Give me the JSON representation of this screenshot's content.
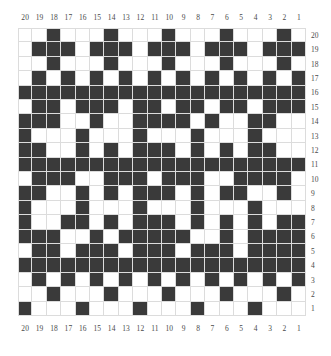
{
  "colors": {
    "filled": "#3a3a3a",
    "empty": "#ffffff",
    "gridline": "#dcdcdc",
    "label": "#4a4a4a",
    "background": "#ffffff"
  },
  "axes": {
    "column_labels_top": [
      "20",
      "19",
      "18",
      "17",
      "16",
      "15",
      "14",
      "13",
      "12",
      "11",
      "10",
      "9",
      "8",
      "7",
      "6",
      "5",
      "4",
      "3",
      "2",
      "1"
    ],
    "column_labels_bottom": [
      "20",
      "19",
      "18",
      "17",
      "16",
      "15",
      "14",
      "13",
      "12",
      "11",
      "10",
      "9",
      "8",
      "7",
      "6",
      "5",
      "4",
      "3",
      "2",
      "1"
    ],
    "row_labels_right": [
      "20",
      "19",
      "18",
      "17",
      "16",
      "15",
      "14",
      "13",
      "12",
      "11",
      "10",
      "9",
      "8",
      "7",
      "6",
      "5",
      "4",
      "3",
      "2",
      "1"
    ]
  },
  "chart_data": {
    "type": "heatmap",
    "title": "",
    "xlabel": "",
    "ylabel": "",
    "rows": 20,
    "cols": 20,
    "value_map": {
      "0": "empty",
      "1": "filled"
    },
    "x_tick_labels": [
      "20",
      "19",
      "18",
      "17",
      "16",
      "15",
      "14",
      "13",
      "12",
      "11",
      "10",
      "9",
      "8",
      "7",
      "6",
      "5",
      "4",
      "3",
      "2",
      "1"
    ],
    "y_tick_labels": [
      "20",
      "19",
      "18",
      "17",
      "16",
      "15",
      "14",
      "13",
      "12",
      "11",
      "10",
      "9",
      "8",
      "7",
      "6",
      "5",
      "4",
      "3",
      "2",
      "1"
    ],
    "grid": true,
    "legend": "none",
    "matrix": [
      [
        0,
        0,
        1,
        0,
        0,
        0,
        1,
        0,
        0,
        0,
        1,
        0,
        0,
        0,
        1,
        0,
        0,
        0,
        1,
        0
      ],
      [
        0,
        1,
        1,
        1,
        0,
        1,
        1,
        1,
        0,
        1,
        1,
        1,
        0,
        1,
        1,
        1,
        0,
        1,
        1,
        1
      ],
      [
        0,
        0,
        1,
        0,
        0,
        0,
        1,
        0,
        0,
        0,
        1,
        0,
        0,
        0,
        1,
        0,
        0,
        0,
        1,
        0
      ],
      [
        0,
        1,
        0,
        1,
        0,
        1,
        0,
        1,
        0,
        1,
        0,
        1,
        0,
        1,
        0,
        1,
        0,
        1,
        0,
        1
      ],
      [
        1,
        1,
        1,
        1,
        1,
        1,
        1,
        1,
        1,
        1,
        1,
        1,
        1,
        1,
        1,
        1,
        1,
        1,
        1,
        1
      ],
      [
        0,
        1,
        1,
        0,
        1,
        1,
        1,
        0,
        1,
        1,
        0,
        1,
        1,
        0,
        1,
        1,
        0,
        1,
        1,
        1
      ],
      [
        1,
        1,
        1,
        0,
        0,
        1,
        0,
        0,
        1,
        1,
        1,
        1,
        0,
        1,
        0,
        0,
        1,
        1,
        0,
        0
      ],
      [
        1,
        0,
        0,
        0,
        1,
        0,
        0,
        0,
        1,
        0,
        0,
        0,
        1,
        0,
        0,
        0,
        1,
        0,
        0,
        0
      ],
      [
        1,
        1,
        0,
        0,
        1,
        0,
        1,
        0,
        1,
        1,
        1,
        0,
        1,
        0,
        1,
        0,
        1,
        1,
        0,
        0
      ],
      [
        1,
        1,
        1,
        1,
        1,
        1,
        1,
        1,
        1,
        1,
        1,
        1,
        1,
        1,
        1,
        1,
        1,
        1,
        1,
        1
      ],
      [
        0,
        1,
        1,
        1,
        0,
        0,
        1,
        1,
        1,
        0,
        1,
        1,
        1,
        0,
        0,
        1,
        1,
        1,
        1,
        0
      ],
      [
        1,
        1,
        0,
        0,
        1,
        0,
        1,
        0,
        1,
        1,
        1,
        0,
        1,
        0,
        1,
        1,
        0,
        0,
        1,
        0
      ],
      [
        1,
        0,
        0,
        0,
        1,
        0,
        0,
        0,
        1,
        0,
        0,
        0,
        1,
        0,
        0,
        0,
        1,
        0,
        0,
        0
      ],
      [
        1,
        0,
        0,
        1,
        1,
        0,
        1,
        0,
        1,
        1,
        1,
        0,
        1,
        0,
        1,
        0,
        1,
        0,
        1,
        1
      ],
      [
        1,
        1,
        1,
        0,
        0,
        1,
        0,
        1,
        1,
        1,
        1,
        1,
        0,
        0,
        1,
        0,
        1,
        1,
        1,
        1
      ],
      [
        0,
        1,
        1,
        0,
        1,
        1,
        1,
        0,
        1,
        1,
        1,
        0,
        1,
        1,
        1,
        0,
        1,
        1,
        1,
        1
      ],
      [
        1,
        1,
        1,
        1,
        1,
        1,
        1,
        1,
        1,
        1,
        1,
        1,
        1,
        1,
        1,
        1,
        1,
        1,
        1,
        1
      ],
      [
        0,
        1,
        0,
        1,
        0,
        1,
        0,
        1,
        0,
        1,
        0,
        1,
        0,
        1,
        0,
        1,
        0,
        1,
        0,
        1
      ],
      [
        0,
        0,
        1,
        0,
        0,
        0,
        1,
        0,
        0,
        0,
        1,
        0,
        0,
        0,
        1,
        0,
        0,
        0,
        1,
        0
      ],
      [
        1,
        0,
        0,
        0,
        1,
        0,
        0,
        0,
        1,
        0,
        0,
        0,
        1,
        0,
        0,
        0,
        1,
        0,
        0,
        0
      ]
    ]
  }
}
